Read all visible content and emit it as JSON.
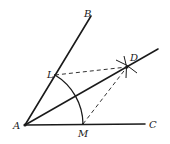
{
  "diagram": {
    "points": {
      "A": {
        "label": "A",
        "x": 25,
        "y": 125
      },
      "B": {
        "label": "B",
        "x": 91,
        "y": 16
      },
      "C": {
        "label": "C",
        "x": 145,
        "y": 124
      },
      "D": {
        "label": "D",
        "x": 127,
        "y": 67
      },
      "L": {
        "label": "L",
        "x": 55,
        "y": 75
      },
      "M": {
        "label": "M",
        "x": 83,
        "y": 124
      }
    },
    "segments": [
      {
        "from": "A",
        "to": "B",
        "style": "solid"
      },
      {
        "from": "A",
        "to": "C",
        "style": "solid"
      },
      {
        "from": "A",
        "to": "D",
        "style": "solid",
        "extended": true
      },
      {
        "from": "L",
        "to": "D",
        "style": "dashed"
      },
      {
        "from": "M",
        "to": "D",
        "style": "dashed"
      }
    ],
    "arcs": [
      {
        "center": "A",
        "from": "L",
        "to": "M",
        "radius": 58
      }
    ],
    "colors": {
      "ink": "#1a1a1a",
      "background": "#ffffff"
    }
  }
}
